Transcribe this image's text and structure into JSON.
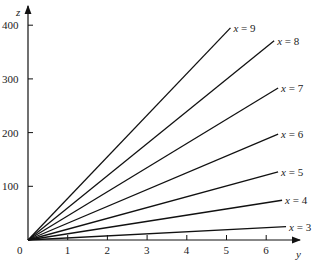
{
  "chart_data": {
    "type": "line",
    "title": "",
    "xlabel": "y",
    "ylabel": "z",
    "xlim": [
      0,
      6.5
    ],
    "ylim": [
      0,
      400
    ],
    "x_ticks": [
      "1",
      "2",
      "3",
      "4",
      "5",
      "6"
    ],
    "y_ticks": [
      "100",
      "200",
      "300",
      "400"
    ],
    "origin_label": "0",
    "grid": false,
    "legend_position": "inline-right",
    "series": [
      {
        "name": "x = 3",
        "x": [
          0,
          6.5
        ],
        "values": [
          0,
          25
        ]
      },
      {
        "name": "x = 4",
        "x": [
          0,
          6.4
        ],
        "values": [
          0,
          74
        ]
      },
      {
        "name": "x = 5",
        "x": [
          0,
          6.3
        ],
        "values": [
          0,
          127
        ]
      },
      {
        "name": "x = 6",
        "x": [
          0,
          6.3
        ],
        "values": [
          0,
          197
        ]
      },
      {
        "name": "x = 7",
        "x": [
          0,
          6.3
        ],
        "values": [
          0,
          283
        ]
      },
      {
        "name": "x = 8",
        "x": [
          0,
          6.2
        ],
        "values": [
          0,
          371
        ]
      },
      {
        "name": "x = 9",
        "x": [
          0,
          5.1
        ],
        "values": [
          0,
          395
        ]
      }
    ]
  }
}
